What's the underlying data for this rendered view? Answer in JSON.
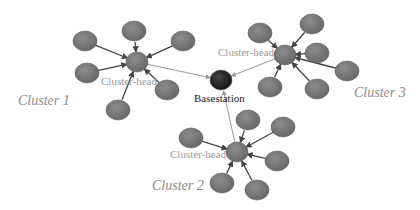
{
  "labels": {
    "cluster1": "Cluster 1",
    "cluster2": "Cluster 2",
    "cluster3": "Cluster 3",
    "head1": "Cluster-head",
    "head2": "Cluster-head",
    "head3": "Cluster-head",
    "basestation": "Basestation"
  },
  "colors": {
    "node": "#7a7a7a",
    "head": "#8a8a8a",
    "basestation": "#2b2b2b",
    "member_arrow": "#555555",
    "head_link": "#9a9a9a"
  },
  "nodes": {
    "basestation": {
      "x": 221,
      "y": 80
    },
    "cluster1": {
      "head": {
        "x": 137,
        "y": 62
      },
      "members": [
        [
          85,
          41
        ],
        [
          134,
          31
        ],
        [
          183,
          41
        ],
        [
          87,
          73
        ],
        [
          167,
          90
        ],
        [
          118,
          110
        ]
      ]
    },
    "cluster2": {
      "head": {
        "x": 237,
        "y": 152
      },
      "members": [
        [
          191,
          138
        ],
        [
          248,
          120
        ],
        [
          283,
          127
        ],
        [
          277,
          161
        ],
        [
          257,
          190
        ],
        [
          222,
          183
        ]
      ]
    },
    "cluster3": {
      "head": {
        "x": 285,
        "y": 55
      },
      "members": [
        [
          260,
          33
        ],
        [
          312,
          24
        ],
        [
          317,
          53
        ],
        [
          347,
          71
        ],
        [
          317,
          89
        ],
        [
          270,
          87
        ]
      ]
    }
  }
}
